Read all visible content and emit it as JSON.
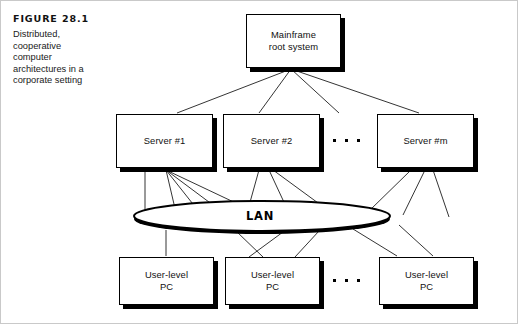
{
  "figure": {
    "number_label": "FIGURE 28.1",
    "caption": "Distributed, cooperative computer architectures in a corporate setting"
  },
  "diagram": {
    "type": "network-hierarchy",
    "colors": {
      "line": "#000000",
      "box_fill": "#ffffff",
      "box_border": "#000000",
      "shadow": "#000000",
      "frame": "#c9c9c9"
    },
    "tiers": [
      {
        "name": "mainframe-tier",
        "nodes": [
          {
            "id": "mainframe",
            "line1": "Mainframe",
            "line2": "root system"
          }
        ]
      },
      {
        "name": "server-tier",
        "ellipsis": "· · ·",
        "nodes": [
          {
            "id": "server-1",
            "line1": "Server #1",
            "line2": ""
          },
          {
            "id": "server-2",
            "line1": "Server #2",
            "line2": ""
          },
          {
            "id": "server-m",
            "line1": "Server #m",
            "line2": ""
          }
        ]
      },
      {
        "name": "lan-tier",
        "nodes": [
          {
            "id": "lan",
            "line1": "LAN",
            "line2": ""
          }
        ]
      },
      {
        "name": "pc-tier",
        "ellipsis": "· · ·",
        "nodes": [
          {
            "id": "pc-1",
            "line1": "User-level",
            "line2": "PC"
          },
          {
            "id": "pc-2",
            "line1": "User-level",
            "line2": "PC"
          },
          {
            "id": "pc-n",
            "line1": "User-level",
            "line2": "PC"
          }
        ]
      }
    ]
  }
}
